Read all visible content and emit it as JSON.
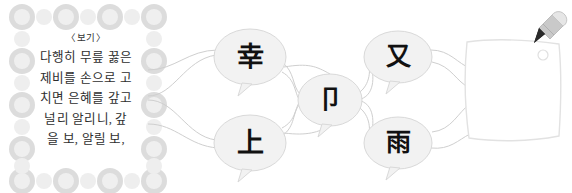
{
  "page": {
    "background_color": "#ffffff",
    "width": 572,
    "height": 193
  },
  "passage": {
    "label": "〈보기〉",
    "lines": [
      "다행히 무릎 꿇은",
      "제비를 손으로 고",
      "치면 은혜를 갚고",
      "널리 알리니, 갚",
      "을 보, 알릴 보,"
    ],
    "text_color": "#2e2e2e",
    "decoration": {
      "name": "circle-border",
      "big_circle_color": "#dcdcdc",
      "small_circle_color": "#efefef"
    }
  },
  "diagram": {
    "type": "character-network",
    "line_color": "#cfcfcf",
    "bubble_fill": "#f2f2f2",
    "bubble_stroke": "#d9d9d9",
    "nodes": [
      {
        "id": "node-top-left",
        "character": "幸",
        "cx": 110,
        "cy": 57,
        "rx": 36,
        "ry": 28
      },
      {
        "id": "node-center",
        "character": "卩",
        "cx": 190,
        "cy": 100,
        "rx": 32,
        "ry": 26
      },
      {
        "id": "node-top-right",
        "character": "又",
        "cx": 258,
        "cy": 57,
        "rx": 34,
        "ry": 26
      },
      {
        "id": "node-bottom-left",
        "character": "上",
        "cx": 110,
        "cy": 143,
        "rx": 36,
        "ry": 28
      },
      {
        "id": "node-bottom-right",
        "character": "雨",
        "cx": 258,
        "cy": 143,
        "rx": 34,
        "ry": 26
      }
    ]
  },
  "note": {
    "name": "blank-answer-note",
    "content": "",
    "paper_color": "#ffffff",
    "paper_stroke": "#e2e2e2",
    "pencil": {
      "name": "pencil-icon",
      "body_color": "#c9c9c9",
      "tip_color": "#2b2b2b"
    },
    "punch_hole": {
      "name": "punch-hole",
      "color": "#e6e6e6"
    }
  }
}
